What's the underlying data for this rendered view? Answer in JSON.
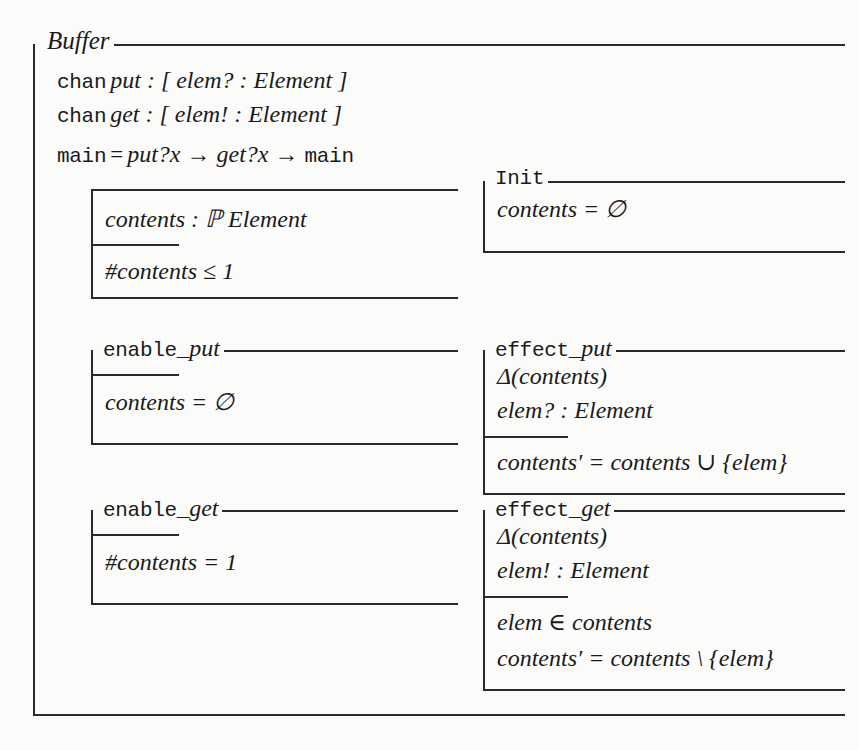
{
  "document": {
    "kind": "z-notation-schema",
    "paper_color": "#fbfbf9",
    "ink_color": "#2a2a2a"
  },
  "buffer": {
    "name": "Buffer",
    "declarations": [
      {
        "id": "chan-put",
        "kw": "chan",
        "body": "put : [ elem? : Element ]"
      },
      {
        "id": "chan-get",
        "kw": "chan",
        "body": "get : [ elem! : Element ]"
      }
    ],
    "main_process": {
      "kw": "main",
      "eq": "=",
      "body": "put?x → get?x → ",
      "tail": "main"
    }
  },
  "state_schema": {
    "name": "",
    "declaration": "contents : ℙ Element",
    "predicate": "#contents ≤ 1"
  },
  "init_schema": {
    "name": "Init",
    "declaration": "contents = ∅"
  },
  "enable_put": {
    "name_tt": "enable_",
    "name_it": "put",
    "predicate": "contents = ∅"
  },
  "effect_put": {
    "name_tt": "effect_",
    "name_it": "put",
    "declarations": [
      "Δ(contents)",
      "elem? : Element"
    ],
    "predicates": [
      "contents′ = contents ∪ {elem}"
    ]
  },
  "enable_get": {
    "name_tt": "enable_",
    "name_it": "get",
    "predicate": "#contents = 1"
  },
  "effect_get": {
    "name_tt": "effect_",
    "name_it": "get",
    "declarations": [
      "Δ(contents)",
      "elem! : Element"
    ],
    "predicates": [
      "elem ∈ contents",
      "contents′ = contents \\ {elem}"
    ]
  }
}
